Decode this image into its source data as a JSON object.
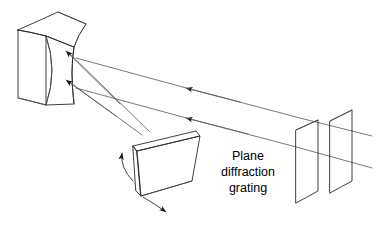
{
  "figure": {
    "background_color": "#ffffff",
    "line_color": "#2b2b2b",
    "ray_color": "#555555",
    "text_color": "#000000",
    "width": 380,
    "height": 225
  },
  "labels": {
    "grating_line1": "Plane",
    "grating_line2": "diffraction",
    "grating_line3": "grating"
  },
  "components": {
    "mirror": {
      "name": "concave-mirror",
      "description": "Concave mirror block shown in 3D perspective at upper left"
    },
    "grating": {
      "name": "plane-diffraction-grating",
      "description": "Tilted flat plate with thickness at lower center"
    },
    "slit_plate_front": {
      "name": "collimator-slit-plate-front",
      "description": "Thin vertical plate at right"
    },
    "slit_plate_rear": {
      "name": "collimator-slit-plate-rear",
      "description": "Second thin vertical plate at far right"
    }
  },
  "rays": [
    {
      "name": "incident-ray-upper",
      "direction": "right-to-left"
    },
    {
      "name": "incident-ray-lower",
      "direction": "right-to-left"
    },
    {
      "name": "reflected-ray-upper",
      "direction": "mirror-to-grating"
    },
    {
      "name": "reflected-ray-lower",
      "direction": "mirror-to-grating"
    },
    {
      "name": "through-slit-ray-upper",
      "direction": "left-to-right"
    },
    {
      "name": "through-slit-ray-lower",
      "direction": "left-to-right"
    }
  ],
  "annotations": {
    "rotation_arrow_up": "grating-rotation-arrow-up",
    "rotation_arrow_down": "grating-rotation-arrow-down"
  }
}
